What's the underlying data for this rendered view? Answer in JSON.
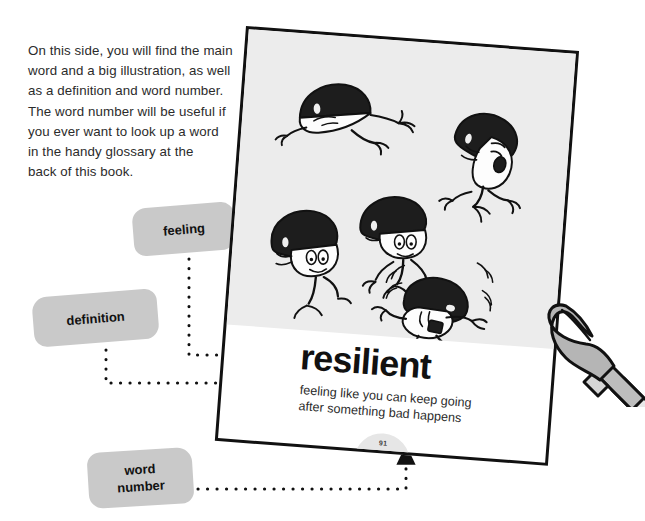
{
  "intro": {
    "text": "On this side, you will find the main\nword and a big illustration, as well\nas a definition and word number.\nThe word number will be useful if\nyou ever want to look up a word\nin the handy glossary at the\nback of this book."
  },
  "callouts": [
    {
      "id": "feeling",
      "label": "feeling"
    },
    {
      "id": "definition",
      "label": "definition"
    },
    {
      "id": "word_number",
      "label": "word\nnumber"
    }
  ],
  "page_card": {
    "main_word": "resilient",
    "definition": "feeling like you can keep going\nafter something bad happens",
    "page_number": "91",
    "illustration_alt": "six cartoon characters with dark bowl-cut hair falling and tumbling"
  },
  "annotations": {
    "hand_pencil": "hand holding a pencil pointing at the page"
  },
  "colors": {
    "label_gray": "#c9c9c9",
    "illustration_gray": "#ececec",
    "page_border": "#111111",
    "text": "#2b2b2b",
    "badge_gray": "#e6e6e6"
  }
}
